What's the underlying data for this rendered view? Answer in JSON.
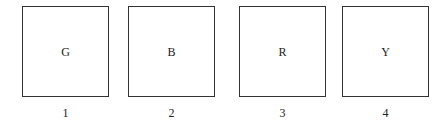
{
  "panels": [
    {
      "letter": "G",
      "number": "1"
    },
    {
      "letter": "B",
      "number": "2"
    },
    {
      "letter": "R",
      "number": "3"
    },
    {
      "letter": "Y",
      "number": "4"
    }
  ]
}
